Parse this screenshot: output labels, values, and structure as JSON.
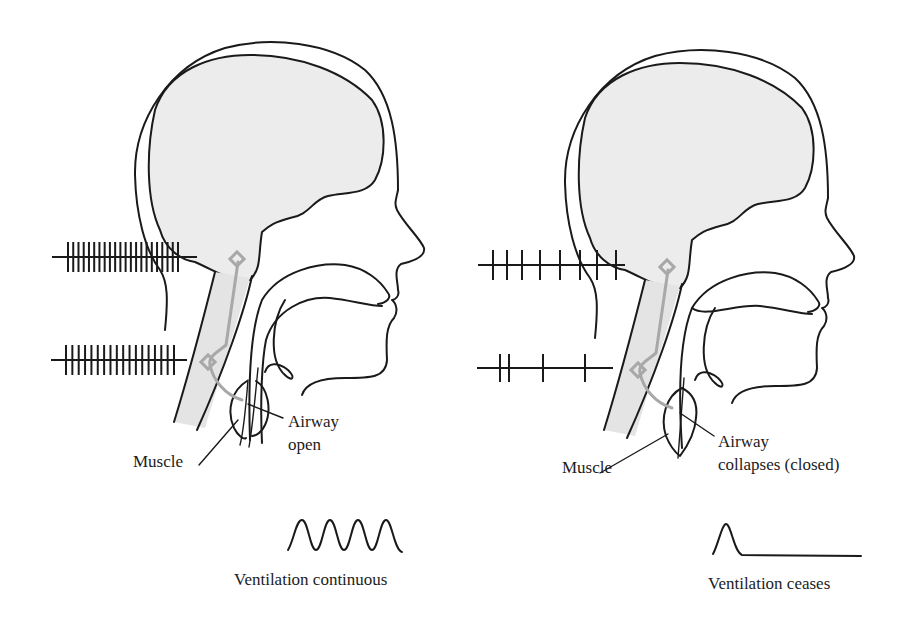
{
  "figure": {
    "background": "#ffffff",
    "brain_fill": "#ececec",
    "nerve_color": "#a8a8a8",
    "line_color": "#1a1a1a"
  },
  "left_panel": {
    "state": "awake / normal",
    "labels": {
      "muscle": "Muscle",
      "airway_line1": "Airway",
      "airway_line2": "open"
    },
    "spike_trains": [
      {
        "name": "upper-neuron-firing",
        "tick_count": 22,
        "density": "high"
      },
      {
        "name": "lower-neuron-firing",
        "tick_count": 18,
        "density": "high"
      }
    ],
    "ventilation": {
      "waveform": "continuous sinusoid, 4 cycles",
      "caption": "Ventilation continuous"
    }
  },
  "right_panel": {
    "state": "apnea",
    "labels": {
      "muscle": "Muscle",
      "airway_line1": "Airway",
      "airway_line2": "collapses (closed)"
    },
    "spike_trains": [
      {
        "name": "upper-neuron-firing",
        "tick_count": 8,
        "density": "reduced"
      },
      {
        "name": "lower-neuron-firing",
        "tick_count": 4,
        "density": "sparse"
      }
    ],
    "ventilation": {
      "waveform": "single breath then flat line",
      "caption": "Ventilation ceases"
    }
  }
}
